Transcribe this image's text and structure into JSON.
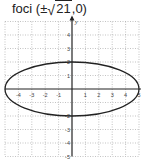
{
  "title": {
    "prefix": "foci (",
    "pm": "±",
    "radicand": "21",
    "suffix": ",0)"
  },
  "chart_data": {
    "type": "line",
    "title": "foci (±√21,0)",
    "curve": "ellipse",
    "equation": "x^2/25 + y^2/4 = 1",
    "center": [
      0,
      0
    ],
    "semi_major_x": 5,
    "semi_minor_y": 2,
    "foci": [
      [
        -4.583,
        0
      ],
      [
        4.583,
        0
      ]
    ],
    "xlim": [
      -5,
      5
    ],
    "ylim": [
      -5,
      5
    ],
    "grid": true,
    "x_tick_labels": [
      "-4",
      "-3",
      "-2",
      "-1",
      "1",
      "2",
      "3",
      "4",
      "5"
    ],
    "y_tick_labels": [
      "4",
      "3",
      "2",
      "1",
      "-2",
      "-3",
      "-4",
      "-5"
    ],
    "xlabel": "",
    "ylabel": "y"
  }
}
